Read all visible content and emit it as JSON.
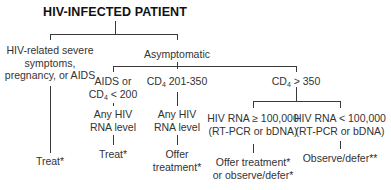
{
  "title": "HIV-INFECTED PATIENT",
  "branches": {
    "symptomatic": {
      "line1": "HIV-related severe",
      "line2": "symptoms,",
      "line3": "pregnancy, or AIDS",
      "outcome": "Treat*"
    },
    "asymptomatic": {
      "label": "Asymptomatic",
      "aids_low_cd4": {
        "line1": "AIDS or",
        "line2_prefix": "CD",
        "line2_sub": "4",
        "line2_suffix": " < 200",
        "rna_line1": "Any HIV",
        "rna_line2": "RNA level",
        "outcome": "Treat*"
      },
      "cd4_mid": {
        "prefix": "CD",
        "sub": "4",
        "suffix": " 201-350",
        "rna_line1": "Any HIV",
        "rna_line2": "RNA level",
        "outcome_line1": "Offer",
        "outcome_line2": "treatment*"
      },
      "cd4_high": {
        "prefix": "CD",
        "sub": "4",
        "suffix": " > 350",
        "high_rna": {
          "line1": "HIV RNA ≥ 100,000",
          "line2": "(RT-PCR or bDNA)",
          "outcome_line1": "Offer treatment*",
          "outcome_line2": "or observe/defer*"
        },
        "low_rna": {
          "line1": "HIV RNA < 100,000",
          "line2": "(RT-PCR or bDNA)",
          "outcome": "Observe/defer**"
        }
      }
    }
  }
}
